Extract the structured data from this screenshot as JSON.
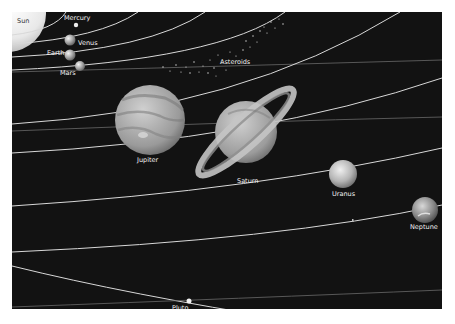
{
  "diagram": {
    "background_color": "#121212",
    "orbit_color": "#d8d8d8",
    "labels": {
      "sun": "Sun",
      "mercury": "Mercury",
      "venus": "Venus",
      "earth": "Earth",
      "mars": "Mars",
      "asteroids": "Asteroids",
      "jupiter": "Jupiter",
      "saturn": "Saturn",
      "uranus": "Uranus",
      "neptune": "Neptune",
      "pluto": "Pluto"
    },
    "bodies": [
      {
        "name": "Sun",
        "type": "star"
      },
      {
        "name": "Mercury",
        "type": "planet"
      },
      {
        "name": "Venus",
        "type": "planet"
      },
      {
        "name": "Earth",
        "type": "planet"
      },
      {
        "name": "Mars",
        "type": "planet"
      },
      {
        "name": "Asteroids",
        "type": "belt"
      },
      {
        "name": "Jupiter",
        "type": "planet"
      },
      {
        "name": "Saturn",
        "type": "planet"
      },
      {
        "name": "Uranus",
        "type": "planet"
      },
      {
        "name": "Neptune",
        "type": "planet"
      },
      {
        "name": "Pluto",
        "type": "dwarf-planet"
      }
    ]
  }
}
